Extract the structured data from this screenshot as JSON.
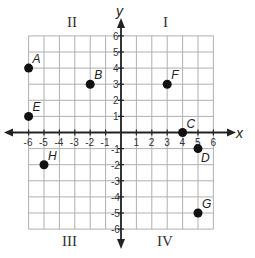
{
  "plot": {
    "x_range": [
      -6,
      6
    ],
    "y_range": [
      -6,
      6
    ],
    "x_axis_label": "x",
    "y_axis_label": "y",
    "x_ticks": [
      "-6",
      "-5",
      "-4",
      "-3",
      "-2",
      "-1",
      "1",
      "2",
      "3",
      "4",
      "5",
      "6"
    ],
    "y_ticks": [
      "6",
      "5",
      "4",
      "3",
      "2",
      "1",
      "-1",
      "-2",
      "-3",
      "-4",
      "-5",
      "-6"
    ],
    "quadrants": {
      "I": "I",
      "II": "II",
      "III": "III",
      "IV": "IV"
    },
    "points": [
      {
        "label": "A",
        "x": -6,
        "y": 4
      },
      {
        "label": "B",
        "x": -2,
        "y": 3
      },
      {
        "label": "C",
        "x": 4,
        "y": 0
      },
      {
        "label": "D",
        "x": 5,
        "y": -1
      },
      {
        "label": "E",
        "x": -6,
        "y": 1
      },
      {
        "label": "F",
        "x": 3,
        "y": 3
      },
      {
        "label": "G",
        "x": 5,
        "y": -5
      },
      {
        "label": "H",
        "x": -5,
        "y": -2
      }
    ],
    "colors": {
      "grid": "#b0b0b0",
      "axis": "#222222",
      "point": "#111111"
    }
  }
}
